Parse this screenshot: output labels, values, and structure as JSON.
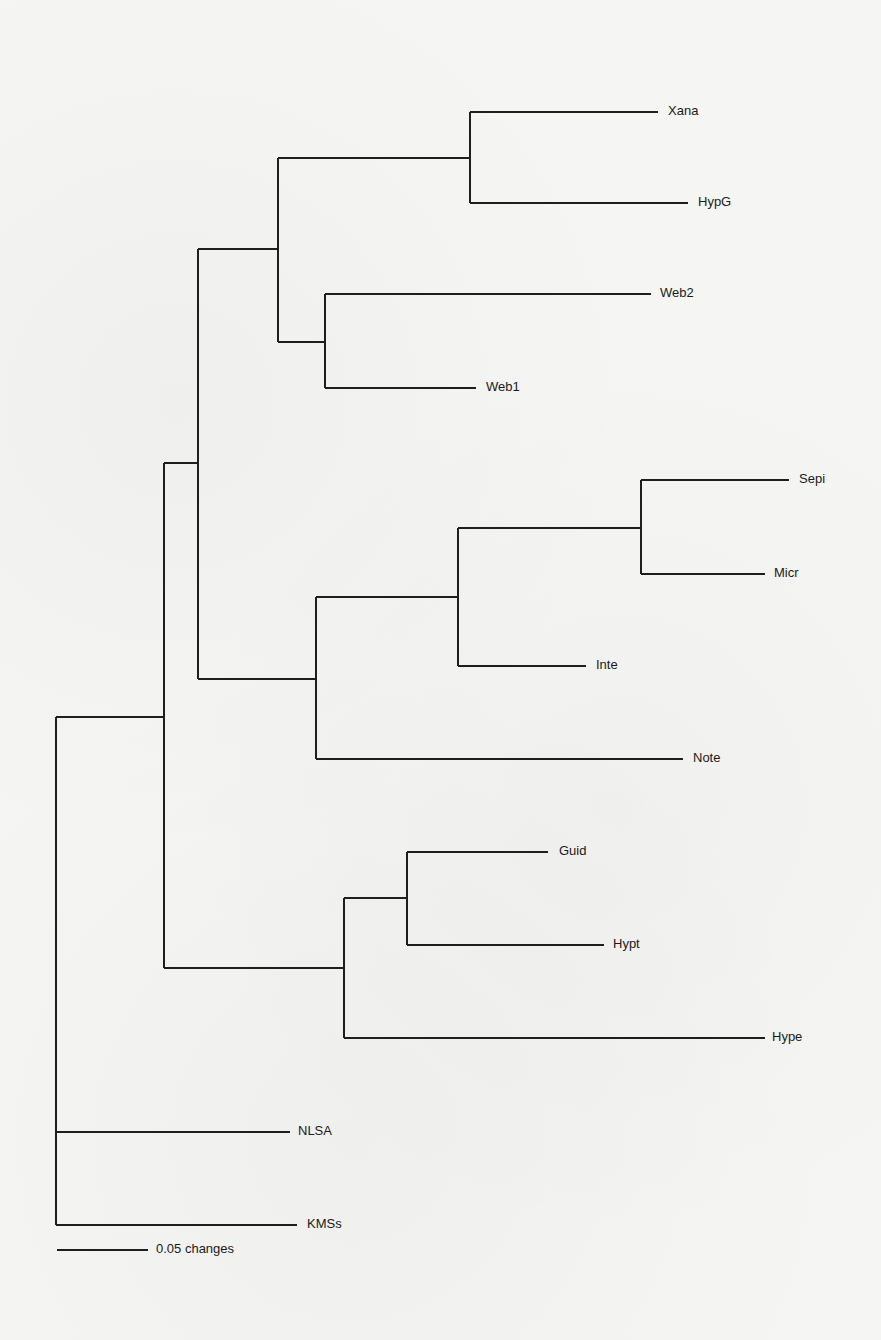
{
  "header": {
    "clipped_title": ""
  },
  "chart_data": {
    "type": "phylogram",
    "title": "",
    "scale_bar": {
      "label": "0.05 changes",
      "length_px": 91,
      "value": 0.05
    },
    "leaves": [
      {
        "name": "Xana",
        "y": 112,
        "tip_x": 658,
        "label_x": 668
      },
      {
        "name": "HypG",
        "y": 203,
        "tip_x": 688,
        "label_x": 698
      },
      {
        "name": "Web2",
        "y": 294,
        "tip_x": 651,
        "label_x": 660
      },
      {
        "name": "Web1",
        "y": 388,
        "tip_x": 476,
        "label_x": 486
      },
      {
        "name": "Sepi",
        "y": 480,
        "tip_x": 789,
        "label_x": 799
      },
      {
        "name": "Micr",
        "y": 574,
        "tip_x": 765,
        "label_x": 774
      },
      {
        "name": "Inte",
        "y": 666,
        "tip_x": 586,
        "label_x": 596
      },
      {
        "name": "Note",
        "y": 759,
        "tip_x": 683,
        "label_x": 693
      },
      {
        "name": "Guid",
        "y": 852,
        "tip_x": 548,
        "label_x": 559
      },
      {
        "name": "Hypt",
        "y": 945,
        "tip_x": 604,
        "label_x": 613
      },
      {
        "name": "Hype",
        "y": 1038,
        "tip_x": 765,
        "label_x": 772
      },
      {
        "name": "NLSA",
        "y": 1132,
        "tip_x": 290,
        "label_x": 298
      },
      {
        "name": "KMSs",
        "y": 1225,
        "tip_x": 297,
        "label_x": 307
      }
    ],
    "internal_nodes": [
      {
        "id": "root",
        "x": 56,
        "y_top": 717,
        "y_bottom": 1225
      },
      {
        "id": "n1",
        "x": 164,
        "y_top": 463,
        "y_bottom": 968,
        "parent_y": 717
      },
      {
        "id": "n2",
        "x": 198,
        "y_top": 249,
        "y_bottom": 679,
        "parent_y": 463
      },
      {
        "id": "n3",
        "x": 278,
        "y_top": 158,
        "y_bottom": 342,
        "parent_y": 249
      },
      {
        "id": "n4",
        "x": 470,
        "y_top": 112,
        "y_bottom": 203,
        "parent_y": 158
      },
      {
        "id": "n5",
        "x": 325,
        "y_top": 294,
        "y_bottom": 388,
        "parent_y": 342
      },
      {
        "id": "n6",
        "x": 316,
        "y_top": 597,
        "y_bottom": 759,
        "parent_y": 679
      },
      {
        "id": "n7",
        "x": 458,
        "y_top": 528,
        "y_bottom": 666,
        "parent_y": 597
      },
      {
        "id": "n8",
        "x": 641,
        "y_top": 480,
        "y_bottom": 574,
        "parent_y": 528
      },
      {
        "id": "n9",
        "x": 344,
        "y_top": 898,
        "y_bottom": 1038,
        "parent_y": 968
      },
      {
        "id": "n10",
        "x": 407,
        "y_top": 852,
        "y_bottom": 945,
        "parent_y": 898
      }
    ],
    "topology": "((((Xana,HypG),(Web2,Web1)),(((Sepi,Micr),Inte),Note)),((Guid,Hypt),Hype)),NLSA,KMSs"
  }
}
